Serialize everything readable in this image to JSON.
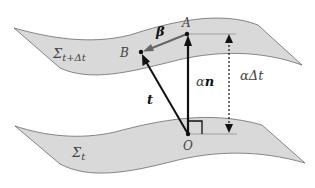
{
  "diagram": {
    "type": "spacetime-foliation",
    "surfaces": [
      {
        "id": "upper",
        "label": "Σ_{t+Δt}",
        "label_main": "Σ",
        "label_sub": "t+Δt"
      },
      {
        "id": "lower",
        "label": "Σ_t",
        "label_main": "Σ",
        "label_sub": "t"
      }
    ],
    "points": [
      {
        "id": "A",
        "label": "A"
      },
      {
        "id": "B",
        "label": "B"
      },
      {
        "id": "O",
        "label": "O"
      }
    ],
    "vectors": [
      {
        "from": "O",
        "to": "A",
        "label": "αn",
        "label_alpha": "α",
        "label_vec": "n"
      },
      {
        "from": "A",
        "to": "B",
        "label": "β"
      },
      {
        "from": "O",
        "to": "B",
        "label": "t"
      }
    ],
    "measure": {
      "label": "αΔt",
      "style": "dashed-double-arrow"
    },
    "colors": {
      "surface_fill": "#d9d9d9",
      "surface_stroke": "#6a6a6a",
      "arrow": "#111111",
      "shift_arrow": "#666666"
    }
  }
}
